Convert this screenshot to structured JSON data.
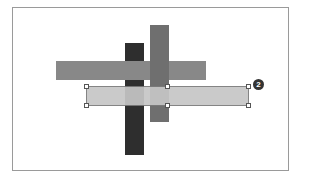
{
  "diagram": {
    "shapes": [
      {
        "name": "dark-vertical-bar",
        "color": "#2e2e2e"
      },
      {
        "name": "mid-gray-vertical-bar",
        "color": "#6f6f6f"
      },
      {
        "name": "gray-horizontal-bar",
        "color": "#888888"
      },
      {
        "name": "selected-light-horizontal-bar",
        "color": "#c6c6c6",
        "selected": true
      }
    ],
    "callout": {
      "label": "2"
    }
  }
}
